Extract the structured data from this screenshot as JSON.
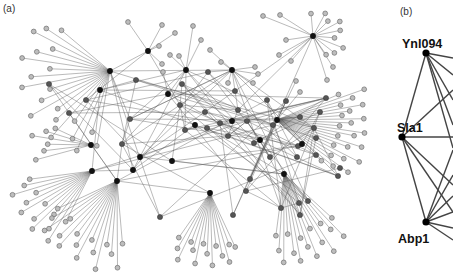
{
  "figure": {
    "panels": [
      {
        "id": "a",
        "label": "(a)",
        "description": "Large protein interaction network with hub nodes (dark), intermediate nodes (mid-gray) and leaf nodes (light gray)",
        "hubs": [
          {
            "id": "h1",
            "x": 110,
            "y": 71,
            "fan": {
              "dir": 200,
              "spread": 120,
              "len": 85,
              "count": 20
            }
          },
          {
            "id": "h2",
            "x": 100,
            "y": 90
          },
          {
            "id": "h3",
            "x": 91,
            "y": 145,
            "fan": {
              "dir": 175,
              "spread": 40,
              "len": 55,
              "count": 6
            }
          },
          {
            "id": "h4",
            "x": 92,
            "y": 171,
            "fan": {
              "dir": 215,
              "spread": 55,
              "len": 80,
              "count": 13
            }
          },
          {
            "id": "h5",
            "x": 117,
            "y": 181,
            "fan": {
              "dir": 240,
              "spread": 70,
              "len": 85,
              "count": 16
            }
          },
          {
            "id": "h6",
            "x": 232,
            "y": 70
          },
          {
            "id": "h7",
            "x": 277,
            "y": 120,
            "fan": {
              "dir": 350,
              "spread": 65,
              "len": 85,
              "count": 22
            }
          },
          {
            "id": "h8",
            "x": 195,
            "y": 125
          },
          {
            "id": "h9",
            "x": 140,
            "y": 157
          },
          {
            "id": "h10",
            "x": 232,
            "y": 121
          },
          {
            "id": "h11",
            "x": 172,
            "y": 161
          },
          {
            "id": "h12",
            "x": 210,
            "y": 193,
            "fan": {
              "dir": 265,
              "spread": 60,
              "len": 70,
              "count": 14
            }
          },
          {
            "id": "h13",
            "x": 284,
            "y": 174,
            "fan": {
              "dir": 290,
              "spread": 55,
              "len": 85,
              "count": 16
            }
          },
          {
            "id": "h14",
            "x": 168,
            "y": 94
          },
          {
            "id": "h15",
            "x": 133,
            "y": 170
          },
          {
            "id": "h16",
            "x": 260,
            "y": 140
          },
          {
            "id": "h17",
            "x": 313,
            "y": 36,
            "fan": {
              "dir": 20,
              "spread": 150,
              "len": 30,
              "count": 10
            }
          },
          {
            "id": "h18",
            "x": 148,
            "y": 51
          },
          {
            "id": "h19",
            "x": 186,
            "y": 70
          },
          {
            "id": "h20",
            "x": 302,
            "y": 144
          }
        ],
        "mid_nodes": [
          [
            49,
            84
          ],
          [
            69,
            113
          ],
          [
            86,
            100
          ],
          [
            122,
            144
          ],
          [
            130,
            119
          ],
          [
            185,
            130
          ],
          [
            220,
            123
          ],
          [
            247,
            121
          ],
          [
            300,
            117
          ],
          [
            326,
            98
          ],
          [
            320,
            112
          ],
          [
            314,
            128
          ],
          [
            316,
            138
          ],
          [
            340,
            168
          ],
          [
            338,
            176
          ],
          [
            308,
            201
          ],
          [
            300,
            215
          ],
          [
            299,
            203
          ],
          [
            250,
            179
          ],
          [
            246,
            191
          ],
          [
            205,
            112
          ],
          [
            207,
            128
          ],
          [
            238,
            110
          ],
          [
            273,
            125
          ],
          [
            270,
            157
          ],
          [
            228,
            136
          ],
          [
            254,
            143
          ],
          [
            180,
            105
          ],
          [
            297,
            157
          ],
          [
            316,
            155
          ],
          [
            160,
            217
          ],
          [
            233,
            215
          ],
          [
            298,
            146
          ],
          [
            281,
            208
          ],
          [
            136,
            80
          ],
          [
            182,
            84
          ],
          [
            208,
            72
          ],
          [
            235,
            91
          ],
          [
            267,
            100
          ],
          [
            286,
            101
          ]
        ],
        "extra_leaves": [
          [
            128,
            22
          ],
          [
            162,
            25
          ],
          [
            175,
            33
          ],
          [
            193,
            26
          ],
          [
            201,
            40
          ],
          [
            210,
            50
          ],
          [
            221,
            62
          ],
          [
            228,
            83
          ],
          [
            255,
            67
          ],
          [
            296,
            81
          ],
          [
            300,
            92
          ],
          [
            333,
            67
          ],
          [
            327,
            80
          ],
          [
            258,
            74
          ],
          [
            253,
            83
          ],
          [
            279,
            55
          ],
          [
            159,
            46
          ],
          [
            162,
            64
          ],
          [
            163,
            72
          ],
          [
            170,
            55
          ],
          [
            179,
            56
          ],
          [
            263,
            16
          ],
          [
            280,
            15
          ],
          [
            286,
            40
          ],
          [
            291,
            61
          ]
        ],
        "edges_density": 170
      },
      {
        "id": "b",
        "label": "(b)",
        "description": "Sub-network of three proteins and their connections",
        "nodes": [
          {
            "name": "Ynl094",
            "x": 426,
            "y": 53,
            "label_x": 402,
            "label_y": 48
          },
          {
            "name": "Sla1",
            "x": 402,
            "y": 137,
            "label_x": 397,
            "label_y": 132
          },
          {
            "name": "Abp1",
            "x": 426,
            "y": 222,
            "label_x": 398,
            "label_y": 243
          }
        ],
        "edges": [
          [
            "Ynl094",
            "Sla1"
          ],
          [
            "Sla1",
            "Abp1"
          ],
          [
            426,
            53,
            453,
            58
          ],
          [
            426,
            53,
            453,
            75
          ],
          [
            426,
            53,
            453,
            100
          ],
          [
            426,
            53,
            453,
            125
          ],
          [
            426,
            53,
            453,
            148
          ],
          [
            402,
            137,
            453,
            90
          ],
          [
            402,
            137,
            453,
            137
          ],
          [
            402,
            137,
            453,
            185
          ],
          [
            402,
            137,
            453,
            212
          ],
          [
            426,
            222,
            453,
            150
          ],
          [
            426,
            222,
            453,
            175
          ],
          [
            426,
            222,
            453,
            196
          ],
          [
            426,
            222,
            453,
            212
          ],
          [
            426,
            222,
            453,
            228
          ],
          [
            426,
            222,
            453,
            240
          ]
        ]
      }
    ]
  }
}
